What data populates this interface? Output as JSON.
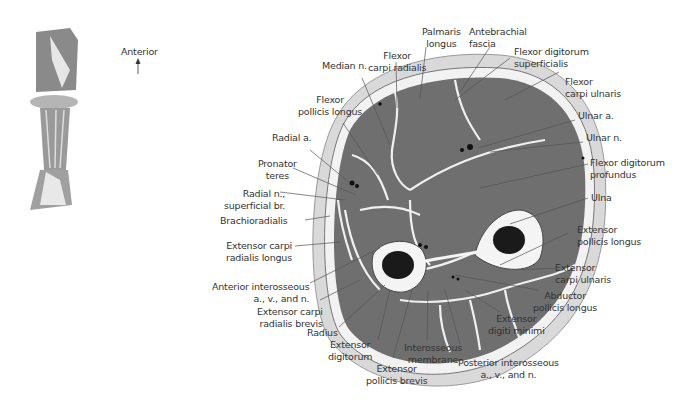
{
  "orientation": {
    "label": "Anterior",
    "arrow_icon": "up-arrow-icon"
  },
  "thumbnail": {
    "description": "forearm-overview-illustration"
  },
  "labels": {
    "palmaris_longus": [
      "Palmaris",
      "longus"
    ],
    "antebrachial_fascia": [
      "Antebrachial",
      "fascia"
    ],
    "median_n": [
      "Median n."
    ],
    "flexor_carpi_radialis": [
      "Flexor",
      "carpi radialis"
    ],
    "flexor_digitorum_superficialis": [
      "Flexor digitorum",
      "superficialis"
    ],
    "flexor_carpi_ulnaris": [
      "Flexor",
      "carpi ulnaris"
    ],
    "flexor_pollicis_longus": [
      "Flexor",
      "pollicis longus"
    ],
    "ulnar_a": [
      "Ulnar a."
    ],
    "ulnar_n": [
      "Ulnar n."
    ],
    "radial_a": [
      "Radial a."
    ],
    "pronator_teres": [
      "Pronator",
      "teres"
    ],
    "flexor_digitorum_profundus": [
      "Flexor digitorum",
      "profundus"
    ],
    "radial_n_superficial": [
      "Radial n.,",
      "superficial br."
    ],
    "ulna": [
      "Ulna"
    ],
    "brachioradialis": [
      "Brachioradialis"
    ],
    "extensor_carpi_radialis_longus": [
      "Extensor carpi",
      "radialis longus"
    ],
    "extensor_pollicis_longus": [
      "Extensor",
      "pollicis longus"
    ],
    "anterior_interosseous": [
      "Anterior interosseous",
      "a., v., and n."
    ],
    "extensor_carpi_ulnaris": [
      "Extensor",
      "carpi ulnaris"
    ],
    "extensor_carpi_radialis_brevis": [
      "Extensor carpi",
      "radialis brevis"
    ],
    "abductor_pollicis_longus": [
      "Abductor",
      "pollicis longus"
    ],
    "radius": [
      "Radius"
    ],
    "extensor_digiti_minimi": [
      "Extensor",
      "digiti minimi"
    ],
    "extensor_digitorum": [
      "Extensor",
      "digitorum"
    ],
    "interosseous_membrane": [
      "Interosseous",
      "membrane"
    ],
    "extensor_pollicis_brevis": [
      "Extensor",
      "pollicis brevis"
    ],
    "posterior_interosseous": [
      "Posterior interosseous",
      "a., v., and n."
    ]
  },
  "colors": {
    "muscle": "#6f6f6f",
    "skin": "#d6d6d6",
    "fascia": "#f2f2f2",
    "bone_marrow": "#1a1a1a",
    "text": "#333333"
  }
}
